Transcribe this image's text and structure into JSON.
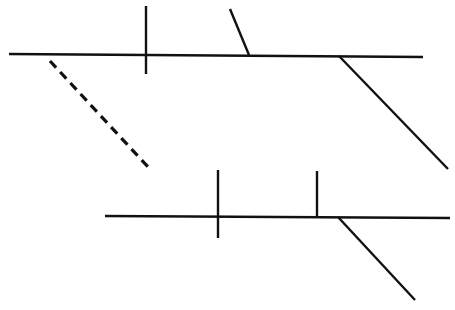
{
  "diagram": {
    "type": "sentence-diagram",
    "stroke_color": "#111111",
    "background": "#ffffff",
    "lines": [
      {
        "name": "main-baseline-top",
        "x1": 9,
        "y1": 54,
        "x2": 423,
        "y2": 57
      },
      {
        "name": "subject-predicate-divider-top",
        "x1": 146,
        "y1": 6,
        "x2": 146,
        "y2": 74
      },
      {
        "name": "object-slant-divider-top",
        "x1": 230,
        "y1": 9,
        "x2": 249,
        "y2": 55
      },
      {
        "name": "modifier-diagonal-top-right",
        "x1": 339,
        "y1": 56,
        "x2": 448,
        "y2": 169
      },
      {
        "name": "connector-dashed",
        "x1": 50,
        "y1": 61,
        "x2": 149,
        "y2": 168,
        "dashed": true
      },
      {
        "name": "main-baseline-bottom",
        "x1": 105,
        "y1": 216,
        "x2": 450,
        "y2": 218
      },
      {
        "name": "subject-predicate-divider-bottom",
        "x1": 218,
        "y1": 170,
        "x2": 218,
        "y2": 238
      },
      {
        "name": "object-divider-bottom",
        "x1": 317,
        "y1": 171,
        "x2": 317,
        "y2": 217
      },
      {
        "name": "modifier-diagonal-bottom-right",
        "x1": 338,
        "y1": 217,
        "x2": 415,
        "y2": 300
      }
    ]
  }
}
